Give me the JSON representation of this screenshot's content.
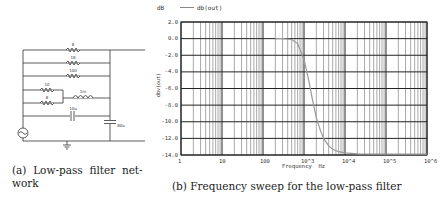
{
  "figure_a": {
    "caption": "(a) Low-pass filter network",
    "caption_line1": "(a)  Low-pass  filter  net-",
    "caption_line2": "work",
    "components": {
      "r1": "8",
      "r2": "18",
      "r3": "100",
      "r4": "10",
      "r5": "8",
      "inductor": "1m",
      "cap_series": "10u",
      "cap_shunt": "80u"
    }
  },
  "figure_b": {
    "caption": "(b) Frequency sweep for the low-pass filter",
    "unit_label": "dB",
    "legend_label": "db(out)",
    "xlabel": "Frequency  Hz",
    "ylabel": "dbv(out)",
    "yticks": [
      "2.0",
      "0.0",
      "-2.0",
      "-4.0",
      "-6.0",
      "-8.0",
      "-10.0",
      "-12.0",
      "-14.0"
    ],
    "xticks": [
      "1",
      "10",
      "100",
      "10^3",
      "10^4",
      "10^5",
      "10^6"
    ]
  },
  "chart_data": {
    "type": "line",
    "title": "",
    "xlabel": "Frequency Hz",
    "ylabel": "dbv(out)",
    "xscale": "log",
    "xlim": [
      1,
      1000000
    ],
    "ylim": [
      -14.0,
      2.0
    ],
    "grid": true,
    "legend": [
      "db(out)"
    ],
    "legend_position": "top-left",
    "series": [
      {
        "name": "db(out)",
        "x": [
          200,
          300,
          500,
          700,
          1000,
          1300,
          1600,
          2000,
          2500,
          3000,
          4000,
          5000,
          7000,
          10000,
          20000,
          100000,
          1000000
        ],
        "values": [
          0.0,
          0.0,
          -0.1,
          -0.6,
          -2.5,
          -5.0,
          -7.3,
          -9.5,
          -11.0,
          -12.0,
          -12.9,
          -13.3,
          -13.6,
          -13.75,
          -13.85,
          -13.9,
          -13.9
        ]
      }
    ]
  }
}
